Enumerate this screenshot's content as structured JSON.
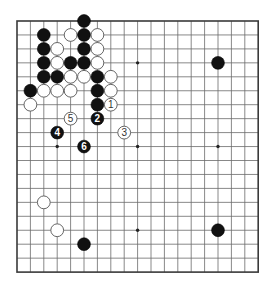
{
  "board": {
    "size": 19,
    "origin_x": 17,
    "origin_y": 21,
    "step_x": 13.4,
    "step_y": 13.95,
    "stone_radius": 6.4,
    "colors": {
      "black": "#111111",
      "white": "#ffffff",
      "line": "#6a6a6a",
      "frame": "#3a3a3a"
    }
  },
  "star_points": [
    [
      3,
      3
    ],
    [
      9,
      3
    ],
    [
      15,
      3
    ],
    [
      3,
      9
    ],
    [
      9,
      9
    ],
    [
      15,
      9
    ],
    [
      3,
      15
    ],
    [
      9,
      15
    ],
    [
      15,
      15
    ]
  ],
  "stones": [
    {
      "color": "black",
      "col": 5,
      "row": 0
    },
    {
      "color": "black",
      "col": 2,
      "row": 1
    },
    {
      "color": "white",
      "col": 4,
      "row": 1
    },
    {
      "color": "black",
      "col": 5,
      "row": 1
    },
    {
      "color": "white",
      "col": 6,
      "row": 1
    },
    {
      "color": "black",
      "col": 2,
      "row": 2
    },
    {
      "color": "white",
      "col": 3,
      "row": 2
    },
    {
      "color": "black",
      "col": 5,
      "row": 2
    },
    {
      "color": "white",
      "col": 6,
      "row": 2
    },
    {
      "color": "black",
      "col": 2,
      "row": 3
    },
    {
      "color": "white",
      "col": 3,
      "row": 3
    },
    {
      "color": "black",
      "col": 4,
      "row": 3
    },
    {
      "color": "black",
      "col": 5,
      "row": 3
    },
    {
      "color": "white",
      "col": 6,
      "row": 3
    },
    {
      "color": "black",
      "col": 2,
      "row": 4
    },
    {
      "color": "black",
      "col": 3,
      "row": 4
    },
    {
      "color": "white",
      "col": 4,
      "row": 4
    },
    {
      "color": "white",
      "col": 5,
      "row": 4
    },
    {
      "color": "black",
      "col": 6,
      "row": 4
    },
    {
      "color": "white",
      "col": 7,
      "row": 4
    },
    {
      "color": "black",
      "col": 1,
      "row": 5
    },
    {
      "color": "white",
      "col": 2,
      "row": 5
    },
    {
      "color": "white",
      "col": 3,
      "row": 5
    },
    {
      "color": "white",
      "col": 4,
      "row": 5
    },
    {
      "color": "black",
      "col": 6,
      "row": 5
    },
    {
      "color": "white",
      "col": 7,
      "row": 5
    },
    {
      "color": "white",
      "col": 1,
      "row": 6
    },
    {
      "color": "black",
      "col": 6,
      "row": 6
    },
    {
      "color": "white",
      "col": 7,
      "row": 6,
      "label": "1"
    },
    {
      "color": "black",
      "col": 6,
      "row": 7,
      "label": "2"
    },
    {
      "color": "white",
      "col": 8,
      "row": 8,
      "label": "3"
    },
    {
      "color": "black",
      "col": 3,
      "row": 8,
      "label": "4"
    },
    {
      "color": "white",
      "col": 4,
      "row": 7,
      "label": "5"
    },
    {
      "color": "black",
      "col": 5,
      "row": 9,
      "label": "6"
    },
    {
      "color": "black",
      "col": 15,
      "row": 3
    },
    {
      "color": "white",
      "col": 2,
      "row": 13
    },
    {
      "color": "white",
      "col": 3,
      "row": 15
    },
    {
      "color": "black",
      "col": 5,
      "row": 16
    },
    {
      "color": "black",
      "col": 15,
      "row": 15
    }
  ]
}
